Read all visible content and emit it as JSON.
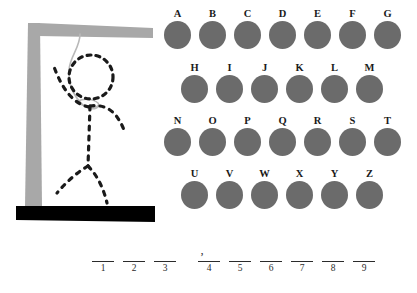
{
  "board": {
    "background_color": "#ffffff",
    "title": "Hangman"
  },
  "gallows": {
    "post_color": "#a8a8a8",
    "beam_color": "#a8a8a8",
    "base_color": "#000000",
    "rope_color": "#b8b8b8",
    "figure_color": "#1a1a1a",
    "parts": [
      "gallows-post",
      "gallows-beam",
      "gallows-base",
      "rope",
      "figure-head",
      "figure-body",
      "figure-left-arm",
      "figure-right-arm",
      "figure-left-leg",
      "figure-right-leg"
    ]
  },
  "alphabet": {
    "disc_color": "#6b6b6b",
    "label_color": "#1a1a1a",
    "rows": [
      {
        "letters": [
          "A",
          "B",
          "C",
          "D",
          "E",
          "F",
          "G"
        ]
      },
      {
        "letters": [
          "H",
          "I",
          "J",
          "K",
          "L",
          "M"
        ]
      },
      {
        "letters": [
          "N",
          "O",
          "P",
          "Q",
          "R",
          "S",
          "T"
        ]
      },
      {
        "letters": [
          "U",
          "V",
          "W",
          "X",
          "Y",
          "Z"
        ]
      }
    ]
  },
  "answer": {
    "apostrophe": "’",
    "groups": [
      {
        "slots": [
          {
            "index": "1",
            "letter": ""
          },
          {
            "index": "2",
            "letter": ""
          },
          {
            "index": "3",
            "letter": ""
          }
        ]
      },
      {
        "slots": [
          {
            "index": "4",
            "letter": ""
          },
          {
            "index": "5",
            "letter": ""
          },
          {
            "index": "6",
            "letter": ""
          },
          {
            "index": "7",
            "letter": ""
          },
          {
            "index": "8",
            "letter": ""
          },
          {
            "index": "9",
            "letter": ""
          }
        ]
      }
    ]
  }
}
